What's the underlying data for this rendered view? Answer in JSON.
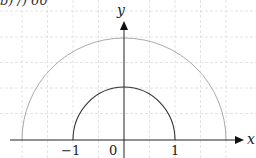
{
  "caption": "b) /) 60",
  "axes": {
    "x_label": "x",
    "y_label": "y",
    "origin_label": "0",
    "ticks": [
      {
        "label": "−1",
        "value": -1
      },
      {
        "label": "1",
        "value": 1
      }
    ]
  },
  "curves": [
    {
      "name": "inner semicircle",
      "radius": 1,
      "color": "#333333"
    },
    {
      "name": "outer semicircle",
      "radius": 2,
      "color": "#aaaaaa"
    }
  ],
  "grid": {
    "style": "dashed",
    "color": "#dddddd",
    "spacing_units": 0.5
  },
  "colors": {
    "axis": "#222222",
    "grid": "#dddddd",
    "inner_curve": "#333333",
    "outer_curve": "#aaaaaa"
  }
}
